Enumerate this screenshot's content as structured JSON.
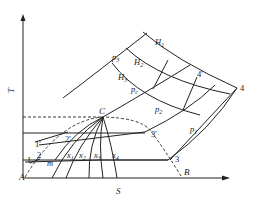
{
  "diagram": {
    "type": "T-S diagram",
    "axes": {
      "y_label": "T",
      "x_label": "S"
    },
    "points": {
      "C": "C",
      "A": "A",
      "B": "B",
      "p1": "1",
      "p1p": "1'",
      "p2": "2",
      "p2p": "2'",
      "p3": "3",
      "p3p": "3'",
      "p4": "4",
      "p4p": "4'",
      "m": "m"
    },
    "isobars": [
      "p3",
      "pc",
      "p2",
      "p1"
    ],
    "isenthalps": [
      "H1",
      "H2",
      "H3"
    ],
    "quality_lines": [
      "x1",
      "x2",
      "x3",
      "x4"
    ],
    "labels": {
      "p3": "p",
      "p3_sub": "3",
      "pc": "p",
      "pc_sub": "c",
      "p2": "p",
      "p2_sub": "2",
      "p1": "p",
      "p1_sub": "1",
      "H1": "H",
      "H1_sub": "1",
      "H2": "H",
      "H2_sub": "2",
      "H3": "H",
      "H3_sub": "3",
      "x1": "x",
      "x1_sub": "1",
      "x2": "x",
      "x2_sub": "2",
      "x3": "x",
      "x3_sub": "3",
      "x4": "x",
      "x4_sub": "4"
    }
  }
}
